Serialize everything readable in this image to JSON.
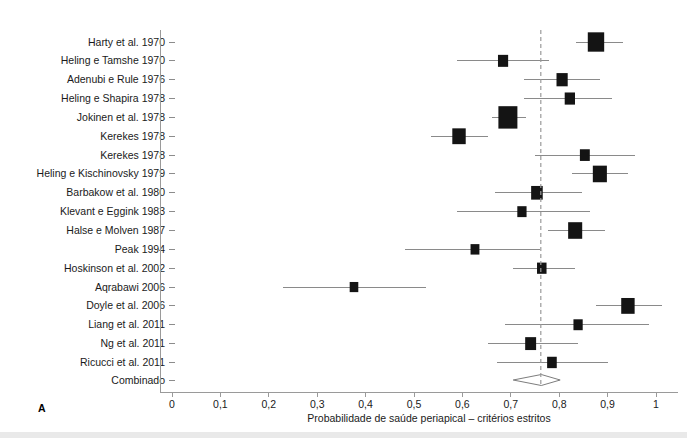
{
  "figure": {
    "panel_letter": "A",
    "x_axis_title": "Probabilidade de saúde periapical – critérios estritos",
    "summary_label": "Combinado"
  },
  "chart_data": {
    "type": "scatter",
    "subtype": "forest-plot",
    "title": "",
    "xlabel": "Probabilidade de saúde periapical – critérios estritos",
    "ylabel": "",
    "xlim": [
      0,
      1.05
    ],
    "xticks": [
      0,
      0.1,
      0.2,
      0.3,
      0.4,
      0.5,
      0.6,
      0.7,
      0.8,
      0.9,
      1
    ],
    "xticklabels": [
      "0",
      "0,1",
      "0,2",
      "0,3",
      "0,4",
      "0,5",
      "0,6",
      "0,7",
      "0,8",
      "0,9",
      "1"
    ],
    "grid": false,
    "legend": "none",
    "reference_line": 0.762,
    "categories": [
      "Harty et al. 1970",
      "Heling e Tamshe 1970",
      "Adenubi e Rule 1976",
      "Heling e Shapira 1978",
      "Jokinen et al. 1978",
      "Kerekes 1978",
      "Kerekes 1978",
      "Heling e Kischinovsky 1979",
      "Barbakow et al. 1980",
      "Klevant e Eggink 1983",
      "Halse e Molven 1987",
      "Peak 1994",
      "Hoskinson et al. 2002",
      "Aqrabawi 2006",
      "Doyle et al. 2006",
      "Liang et al. 2011",
      "Ng et al. 2011",
      "Ricucci et al. 2011"
    ],
    "studies": [
      {
        "label": "Harty et al. 1970",
        "estimate": 0.876,
        "ci_low": 0.835,
        "ci_high": 0.932,
        "weight": 0.8
      },
      {
        "label": "Heling e Tamshe 1970",
        "estimate": 0.684,
        "ci_low": 0.589,
        "ci_high": 0.779,
        "weight": 0.32
      },
      {
        "label": "Adenubi e Rule 1976",
        "estimate": 0.806,
        "ci_low": 0.727,
        "ci_high": 0.884,
        "weight": 0.4
      },
      {
        "label": "Heling e Shapira 1978",
        "estimate": 0.822,
        "ci_low": 0.727,
        "ci_high": 0.909,
        "weight": 0.33
      },
      {
        "label": "Jokinen et al. 1978",
        "estimate": 0.694,
        "ci_low": 0.661,
        "ci_high": 0.731,
        "weight": 1.0
      },
      {
        "label": "Kerekes 1978",
        "estimate": 0.593,
        "ci_low": 0.535,
        "ci_high": 0.653,
        "weight": 0.57
      },
      {
        "label": "Kerekes 1978",
        "estimate": 0.853,
        "ci_low": 0.75,
        "ci_high": 0.957,
        "weight": 0.3
      },
      {
        "label": "Heling e Kischinovsky 1979",
        "estimate": 0.884,
        "ci_low": 0.826,
        "ci_high": 0.942,
        "weight": 0.62
      },
      {
        "label": "Barbakow et al. 1980",
        "estimate": 0.754,
        "ci_low": 0.667,
        "ci_high": 0.847,
        "weight": 0.43
      },
      {
        "label": "Klevant e Eggink 1983",
        "estimate": 0.723,
        "ci_low": 0.589,
        "ci_high": 0.864,
        "weight": 0.25
      },
      {
        "label": "Halse e Molven 1987",
        "estimate": 0.833,
        "ci_low": 0.777,
        "ci_high": 0.895,
        "weight": 0.62
      },
      {
        "label": "Peak 1994",
        "estimate": 0.626,
        "ci_low": 0.481,
        "ci_high": 0.76,
        "weight": 0.22
      },
      {
        "label": "Hoskinson et al. 2002",
        "estimate": 0.764,
        "ci_low": 0.705,
        "ci_high": 0.833,
        "weight": 0.27
      },
      {
        "label": "Aqrabawi 2006",
        "estimate": 0.376,
        "ci_low": 0.229,
        "ci_high": 0.525,
        "weight": 0.2
      },
      {
        "label": "Doyle et al. 2006",
        "estimate": 0.942,
        "ci_low": 0.876,
        "ci_high": 1.012,
        "weight": 0.57
      },
      {
        "label": "Liang et al. 2011",
        "estimate": 0.839,
        "ci_low": 0.688,
        "ci_high": 0.986,
        "weight": 0.25
      },
      {
        "label": "Ng et al. 2011",
        "estimate": 0.741,
        "ci_low": 0.653,
        "ci_high": 0.839,
        "weight": 0.38
      },
      {
        "label": "Ricucci et al. 2011",
        "estimate": 0.785,
        "ci_low": 0.671,
        "ci_high": 0.901,
        "weight": 0.28
      }
    ],
    "summary": {
      "label": "Combinado",
      "estimate": 0.763,
      "ci_low": 0.705,
      "ci_high": 0.802
    }
  }
}
